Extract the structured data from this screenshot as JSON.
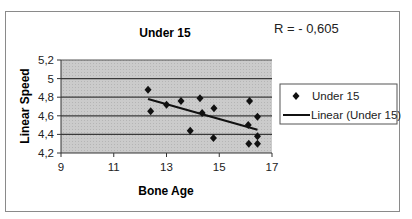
{
  "chart_data": {
    "type": "scatter",
    "title": "Under 15",
    "xlabel": "Bone Age",
    "ylabel": "Linear Speed",
    "xlim": [
      9,
      17
    ],
    "ylim": [
      4.2,
      5.2
    ],
    "x_ticks": [
      "9",
      "11",
      "13",
      "15",
      "17"
    ],
    "y_ticks": [
      "5,2",
      "5",
      "4,8",
      "4,6",
      "4,4",
      "4,2"
    ],
    "grid": true,
    "legend_position": "right",
    "annotation": "R = - 0,605",
    "series": [
      {
        "name": "Under 15",
        "kind": "scatter",
        "marker": "diamond",
        "points": [
          [
            12.3,
            4.88
          ],
          [
            12.4,
            4.65
          ],
          [
            13.0,
            4.72
          ],
          [
            13.55,
            4.76
          ],
          [
            13.9,
            4.44
          ],
          [
            14.27,
            4.79
          ],
          [
            14.35,
            4.63
          ],
          [
            14.8,
            4.68
          ],
          [
            14.78,
            4.36
          ],
          [
            16.15,
            4.76
          ],
          [
            16.1,
            4.5
          ],
          [
            16.45,
            4.59
          ],
          [
            16.45,
            4.38
          ],
          [
            16.12,
            4.3
          ],
          [
            16.45,
            4.3
          ]
        ]
      },
      {
        "name": "Linear (Under 15)",
        "kind": "line",
        "points": [
          [
            12.3,
            4.78
          ],
          [
            16.45,
            4.45
          ]
        ]
      }
    ]
  },
  "colors": {
    "plot_bg": "#c8c8c8",
    "gridline": "#3a3a3a",
    "marker": "#111111",
    "frame": "#8a8a8a"
  }
}
